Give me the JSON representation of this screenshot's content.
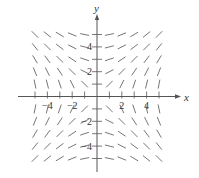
{
  "figure": {
    "type": "slope-field",
    "equation_implied": "dy/dx = x / y",
    "x_axis_label": "x",
    "y_axis_label": "y",
    "x_tick_labels": [
      "−4",
      "−2",
      "2",
      "4"
    ],
    "y_tick_labels": [
      "4",
      "2",
      "−2",
      "−4"
    ],
    "colors": {
      "axis": "#555555",
      "segment": "#666666",
      "text": "#333333",
      "background": "#ffffff"
    }
  },
  "layout": {
    "origin_px": [
      97,
      96.5
    ],
    "unit_px": 12.4,
    "x_range": [
      -5,
      5
    ],
    "y_range": [
      -5,
      5
    ],
    "x_axis_extent_px": [
      18,
      181
    ],
    "y_axis_extent_px": [
      14,
      172
    ],
    "segment_half_length_px": 4.2
  },
  "chart_data": {
    "type": "slope-field",
    "title": "",
    "xlabel": "x",
    "ylabel": "y",
    "xlim": [
      -5,
      5
    ],
    "ylim": [
      -5,
      5
    ],
    "x_ticks_labeled": [
      -4,
      -2,
      2,
      4
    ],
    "y_ticks_labeled": [
      -4,
      -2,
      2,
      4
    ],
    "x_ticks": [
      -5,
      -4,
      -3,
      -2,
      -1,
      1,
      2,
      3,
      4,
      5
    ],
    "y_ticks": [
      -5,
      -4,
      -3,
      -2,
      -1,
      1,
      2,
      3,
      4,
      5
    ],
    "grid_points_x": [
      -5,
      -4,
      -3,
      -2,
      -1,
      1,
      2,
      3,
      4,
      5
    ],
    "grid_points_y": [
      -5,
      -4,
      -3,
      -2,
      -1,
      1,
      2,
      3,
      4,
      5
    ],
    "slope_function": "x/y",
    "grid": false,
    "legend": null
  }
}
